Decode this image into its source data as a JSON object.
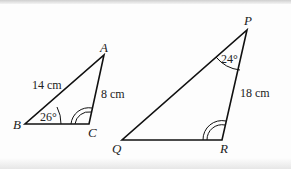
{
  "triangle_abc": {
    "vertices": {
      "A": "A",
      "B": "B",
      "C": "C"
    },
    "side_ab": "14 cm",
    "side_ac": "8 cm",
    "angle_b": "26°"
  },
  "triangle_pqr": {
    "vertices": {
      "P": "P",
      "Q": "Q",
      "R": "R"
    },
    "side_pr": "18 cm",
    "angle_p": "24°"
  }
}
